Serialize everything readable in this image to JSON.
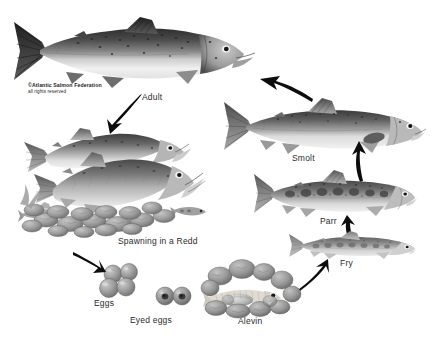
{
  "diagram": {
    "background_color": "#ffffff",
    "width": 437,
    "height": 340
  },
  "credit": {
    "line1": "©Atlantic Salmon Federation",
    "line2": "all rights reserved"
  },
  "stages": [
    {
      "id": "adult",
      "label": "Adult",
      "art": "adult-salmon-illustration"
    },
    {
      "id": "spawning",
      "label": "Spawning in a Redd",
      "art": "spawning-salmon-pair-in-gravel-redd-illustration"
    },
    {
      "id": "eggs",
      "label": "Eggs",
      "art": "salmon-eggs-cluster-illustration"
    },
    {
      "id": "eyedeggs",
      "label": "Eyed eggs",
      "art": "eyed-salmon-eggs-illustration"
    },
    {
      "id": "alevin",
      "label": "Alevin",
      "art": "alevin-with-yolk-sac-in-gravel-illustration"
    },
    {
      "id": "fry",
      "label": "Fry",
      "art": "salmon-fry-illustration"
    },
    {
      "id": "parr",
      "label": "Parr",
      "art": "salmon-parr-illustration"
    },
    {
      "id": "smolt",
      "label": "Smolt",
      "art": "salmon-smolt-illustration"
    }
  ],
  "arrows": [
    {
      "id": "adult-to-spawning",
      "from": "adult",
      "to": "spawning",
      "direction": "down-left"
    },
    {
      "id": "spawning-to-eggs",
      "from": "spawning",
      "to": "eggs",
      "direction": "down-right"
    },
    {
      "id": "eggs-to-alevin",
      "from": "eyedeggs",
      "to": "alevin",
      "direction": "right"
    },
    {
      "id": "alevin-to-fry",
      "from": "alevin",
      "to": "fry",
      "direction": "up-right"
    },
    {
      "id": "fry-to-parr",
      "from": "fry",
      "to": "parr",
      "direction": "up"
    },
    {
      "id": "parr-to-smolt",
      "from": "parr",
      "to": "smolt",
      "direction": "up"
    },
    {
      "id": "smolt-to-adult",
      "from": "smolt",
      "to": "adult",
      "direction": "up-left"
    }
  ],
  "palette": {
    "ink": "#1c1c1c",
    "label_text": "#2b2b2b",
    "fish_dark": "#3c3c3c",
    "fish_mid": "#8a8a8a",
    "fish_light": "#d8d8d8",
    "belly": "#f2f2f2",
    "gravel": "#9a9a9a",
    "egg": "#8e8e8e"
  }
}
